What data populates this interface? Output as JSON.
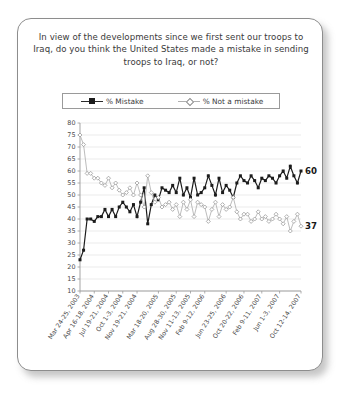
{
  "card": {
    "question": "In view of the developments since we first sent our troops to Iraq, do you think the United States made a mistake in sending troops to Iraq, or not?"
  },
  "legend": {
    "position": "top-center",
    "items": [
      {
        "label": "% Mistake",
        "marker": "filled-square-icon",
        "color": "#1c1c1c"
      },
      {
        "label": "% Not a mistake",
        "marker": "open-diamond-icon",
        "color": "#b0b0b0"
      }
    ]
  },
  "end_labels": {
    "mistake": "60",
    "not_a_mistake": "37"
  },
  "chart_data": {
    "type": "line",
    "title": "In view of the developments since we first sent our troops to Iraq, do you think the United States made a mistake in sending troops to Iraq, or not?",
    "xlabel": "",
    "ylabel": "",
    "ylim": [
      10,
      80
    ],
    "ytick_step": 5,
    "yticks": [
      80,
      75,
      70,
      65,
      60,
      55,
      50,
      45,
      40,
      35,
      30,
      25,
      20,
      15,
      10
    ],
    "grid": true,
    "legend_position": "top-center",
    "tick_labels": [
      "Mar 24-25, 2003",
      "Apr 16-18, 2004",
      "Jul 19-21, 2004",
      "Oct 1-3, 2004",
      "Nov 19-21, 2004",
      "Mar 18-20, 2005",
      "Aug 28-30, 2005",
      "Nov 11-13, 2005",
      "Feb 9-12, 2006",
      "Jun 23-25, 2006",
      "Oct 20-22, 2006",
      "Feb 9-11, 2007",
      "Jun 1-3, 2007",
      "Oct 12-14, 2007"
    ],
    "tick_indices": [
      0,
      4,
      8,
      12,
      16,
      22,
      27,
      31,
      35,
      41,
      46,
      51,
      56,
      62
    ],
    "series": [
      {
        "name": "% Mistake",
        "marker": "filled-square",
        "color": "#1c1c1c",
        "values": [
          23,
          27,
          40,
          40,
          39,
          41,
          41,
          44,
          41,
          44,
          41,
          45,
          47,
          45,
          43,
          46,
          41,
          47,
          53,
          38,
          46,
          50,
          48,
          53,
          52,
          51,
          54,
          51,
          57,
          50,
          53,
          49,
          57,
          50,
          51,
          53,
          58,
          54,
          50,
          57,
          51,
          54,
          52,
          49,
          55,
          58,
          56,
          55,
          58,
          56,
          53,
          57,
          56,
          58,
          57,
          55,
          58,
          60,
          57,
          62,
          58,
          55,
          60
        ]
      },
      {
        "name": "% Not a mistake",
        "marker": "open-diamond",
        "color": "#b0b0b0",
        "values": [
          75,
          71,
          59,
          59,
          57,
          57,
          55,
          54,
          57,
          53,
          55,
          52,
          50,
          51,
          53,
          50,
          55,
          50,
          45,
          58,
          51,
          47,
          49,
          45,
          46,
          47,
          44,
          46,
          41,
          47,
          44,
          48,
          41,
          47,
          46,
          45,
          39,
          44,
          47,
          41,
          46,
          44,
          45,
          49,
          43,
          40,
          42,
          42,
          39,
          40,
          43,
          40,
          41,
          39,
          40,
          42,
          40,
          38,
          41,
          35,
          39,
          42,
          37
        ]
      }
    ]
  }
}
